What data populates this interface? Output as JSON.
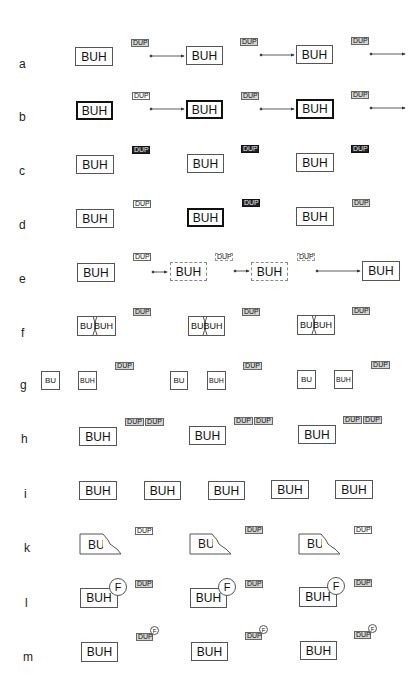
{
  "rows": [
    {
      "id": "a",
      "label": "a"
    },
    {
      "id": "b",
      "label": "b"
    },
    {
      "id": "c",
      "label": "c"
    },
    {
      "id": "d",
      "label": "d"
    },
    {
      "id": "e",
      "label": "e"
    },
    {
      "id": "f",
      "label": "f"
    },
    {
      "id": "g",
      "label": "g"
    },
    {
      "id": "h",
      "label": "h"
    },
    {
      "id": "i",
      "label": "i"
    },
    {
      "id": "k",
      "label": "k"
    },
    {
      "id": "l",
      "label": "l"
    },
    {
      "id": "m",
      "label": "m"
    }
  ],
  "text": {
    "buh": "BUH",
    "bu": "BU",
    "dup": "DUP",
    "f": "F"
  }
}
